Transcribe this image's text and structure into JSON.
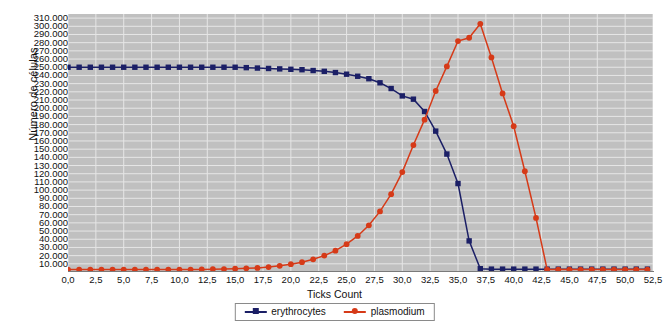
{
  "chart_data": {
    "type": "line",
    "title": "",
    "xlabel": "Ticks Count",
    "ylabel": "Número de células",
    "xlim": [
      0,
      52.5
    ],
    "ylim": [
      0,
      315000
    ],
    "grid": true,
    "legend_position": "bottom",
    "plot_background": "#c0c0c0",
    "gridline_color": "#e6e6e6",
    "x_ticks": [
      "0,0",
      "2,5",
      "5,0",
      "7,5",
      "10,0",
      "12,5",
      "15,0",
      "17,5",
      "20,0",
      "22,5",
      "25,0",
      "27,5",
      "30,0",
      "32,5",
      "35,0",
      "37,5",
      "40,0",
      "42,5",
      "45,0",
      "47,5",
      "50,0",
      "52,5"
    ],
    "x_tick_values": [
      0,
      2.5,
      5,
      7.5,
      10,
      12.5,
      15,
      17.5,
      20,
      22.5,
      25,
      27.5,
      30,
      32.5,
      35,
      37.5,
      40,
      42.5,
      45,
      47.5,
      50,
      52.5
    ],
    "y_ticks": [
      "310.000",
      "300.000",
      "290.000",
      "280.000",
      "270.000",
      "260.000",
      "250.000",
      "240.000",
      "230.000",
      "220.000",
      "210.000",
      "200.000",
      "190.000",
      "180.000",
      "170.000",
      "160.000",
      "150.000",
      "140.000",
      "130.000",
      "120.000",
      "110.000",
      "100.000",
      "90.000",
      "80.000",
      "70.000",
      "60.000",
      "50.000",
      "40.000",
      "30.000",
      "20.000",
      "10.000"
    ],
    "y_tick_values": [
      310000,
      300000,
      290000,
      280000,
      270000,
      260000,
      250000,
      240000,
      230000,
      220000,
      210000,
      200000,
      190000,
      180000,
      170000,
      160000,
      150000,
      140000,
      130000,
      120000,
      110000,
      100000,
      90000,
      80000,
      70000,
      60000,
      50000,
      40000,
      30000,
      20000,
      10000
    ],
    "x": [
      0,
      1,
      2,
      3,
      4,
      5,
      6,
      7,
      8,
      9,
      10,
      11,
      12,
      13,
      14,
      15,
      16,
      17,
      18,
      19,
      20,
      21,
      22,
      23,
      24,
      25,
      26,
      27,
      28,
      29,
      30,
      31,
      32,
      33,
      34,
      35,
      36,
      37,
      38,
      39,
      40,
      41,
      42,
      43,
      44,
      45,
      46,
      47,
      48,
      49,
      50,
      51,
      52
    ],
    "series": [
      {
        "name": "erythrocytes",
        "color": "#1b1f66",
        "marker": "square",
        "values": [
          250000,
          250000,
          250000,
          250000,
          250000,
          250000,
          250000,
          250000,
          250000,
          250000,
          250000,
          250000,
          250000,
          250000,
          250000,
          250000,
          249500,
          249000,
          248500,
          248000,
          247500,
          247000,
          246000,
          245000,
          243500,
          241500,
          239000,
          236000,
          231000,
          224000,
          215000,
          211000,
          196000,
          172000,
          144000,
          108000,
          38000,
          4000,
          3500,
          3500,
          3500,
          3500,
          3500,
          3500,
          3500,
          3500,
          3500,
          3500,
          3500,
          3500,
          3500,
          3500,
          3500
        ]
      },
      {
        "name": "plasmodium",
        "color": "#d63a18",
        "marker": "circle",
        "values": [
          3000,
          3000,
          3000,
          3000,
          3000,
          3000,
          3000,
          3000,
          3000,
          3000,
          3000,
          3000,
          3200,
          3400,
          3600,
          4000,
          4500,
          5000,
          6000,
          7500,
          9500,
          12000,
          15500,
          20000,
          26000,
          34000,
          44000,
          57000,
          74000,
          95000,
          122000,
          155000,
          186000,
          221000,
          251000,
          282000,
          286000,
          303000,
          262000,
          218000,
          178000,
          123000,
          66000,
          3000,
          3000,
          3000,
          3000,
          3000,
          3000,
          3000,
          3000,
          3000,
          3000
        ]
      }
    ]
  },
  "legend": {
    "entries": [
      {
        "label": "erythrocytes",
        "color": "#1b1f66"
      },
      {
        "label": "plasmodium",
        "color": "#d63a18"
      }
    ]
  }
}
